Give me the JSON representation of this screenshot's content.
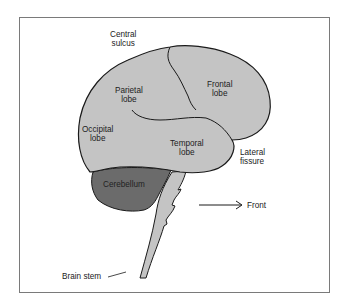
{
  "diagram": {
    "title": "",
    "colors": {
      "cerebrum_fill": "#c4c4c4",
      "cerebellum_fill": "#6b6b6b",
      "brainstem_fill": "#c4c4c4",
      "outline": "#1a1a1a",
      "frame": "#7a7a7a"
    },
    "labels": {
      "central_sulcus": [
        "Central",
        "sulcus"
      ],
      "frontal_lobe": [
        "Frontal",
        "lobe"
      ],
      "parietal_lobe": [
        "Parietal",
        "lobe"
      ],
      "occipital_lobe": [
        "Occipital",
        "lobe"
      ],
      "temporal_lobe": [
        "Temporal",
        "lobe"
      ],
      "lateral_fissure": [
        "Lateral",
        "fissure"
      ],
      "cerebellum": "Cerebellum",
      "front": "Front",
      "brain_stem": "Brain stem"
    }
  }
}
